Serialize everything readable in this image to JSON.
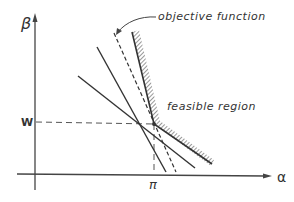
{
  "diagram": {
    "labels": {
      "y_axis": "β",
      "x_axis": "α",
      "y_tick": "W",
      "x_tick": "π",
      "objective": "objective function",
      "feasible": "feasible region"
    },
    "colors": {
      "ink": "#333333",
      "background": "#ffffff"
    }
  }
}
